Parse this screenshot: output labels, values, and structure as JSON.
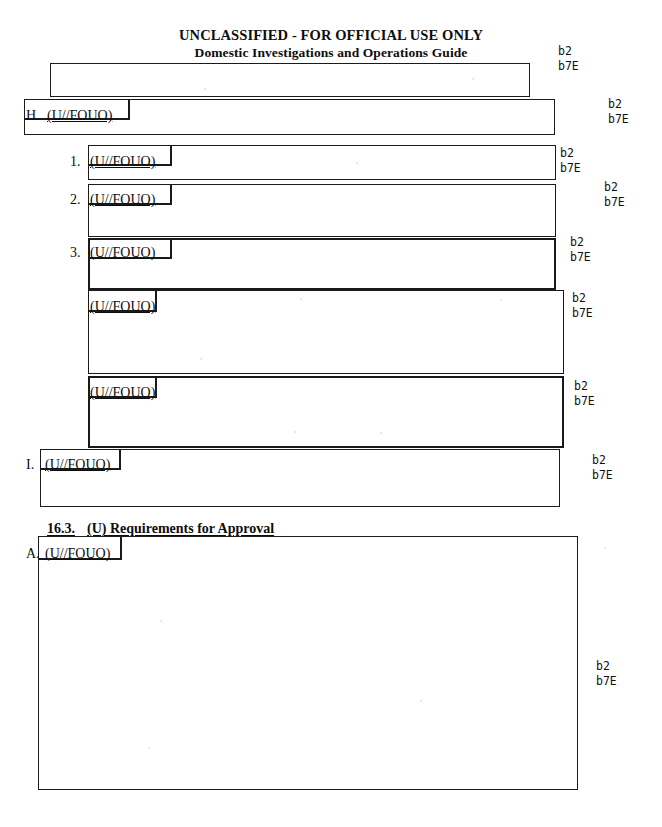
{
  "header": {
    "classification": "UNCLASSIFIED - FOR OFFICIAL USE ONLY",
    "title": "Domestic Investigations and Operations Guide"
  },
  "section": {
    "number": "16.3.",
    "title": "(U) Requirements for Approval"
  },
  "markings": {
    "fouo": "(U//FOUO)"
  },
  "list_labels": {
    "h": "H.",
    "i": "I.",
    "a": "A.",
    "one": "1.",
    "two": "2.",
    "three": "3."
  },
  "exemptions": [
    {
      "code1": "b2",
      "code2": "b7E"
    },
    {
      "code1": "b2",
      "code2": "b7E"
    },
    {
      "code1": "b2",
      "code2": "b7E"
    },
    {
      "code1": "b2",
      "code2": "b7E"
    },
    {
      "code1": "b2",
      "code2": "b7E"
    },
    {
      "code1": "b2",
      "code2": "b7E"
    },
    {
      "code1": "b2",
      "code2": "b7E"
    },
    {
      "code1": "b2",
      "code2": "b7E"
    },
    {
      "code1": "b2",
      "code2": "b7E"
    }
  ],
  "redactions": [
    {
      "id": "redaction-top",
      "withheld": ""
    },
    {
      "id": "redaction-h",
      "withheld": ""
    },
    {
      "id": "redaction-1",
      "withheld": ""
    },
    {
      "id": "redaction-2",
      "withheld": ""
    },
    {
      "id": "redaction-3",
      "withheld": ""
    },
    {
      "id": "redaction-para-4",
      "withheld": ""
    },
    {
      "id": "redaction-para-5",
      "withheld": ""
    },
    {
      "id": "redaction-i",
      "withheld": ""
    },
    {
      "id": "redaction-a",
      "withheld": ""
    }
  ],
  "colors": {
    "ink": "#1a1a1a",
    "paper": "#ffffff"
  }
}
